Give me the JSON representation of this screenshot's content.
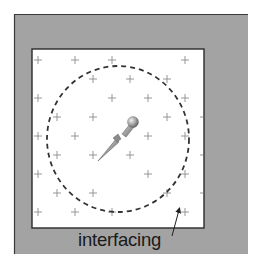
{
  "diagram": {
    "label": "interfacing",
    "colors": {
      "fabric_background": "#a3a3a3",
      "interfacing_fill": "#ffffff",
      "border": "#2a2a2a",
      "cross_marks": "#8c8c8c",
      "dashed_circle": "#333333",
      "pin_head": "#9a9a9a",
      "label_text": "#1a1a1a"
    },
    "outer_fabric": {
      "x": 14,
      "y": 14,
      "width": 234,
      "height": 240
    },
    "interfacing_square": {
      "x": 32,
      "y": 49,
      "width": 172,
      "height": 179
    },
    "dashed_circle": {
      "cx": 118,
      "cy": 139,
      "rx": 71,
      "ry": 73
    },
    "pin": {
      "head": {
        "cx": 133,
        "cy": 122,
        "r": 5
      },
      "tip": {
        "x": 98,
        "y": 161
      }
    },
    "arrow": {
      "from": {
        "x": 172,
        "y": 236
      },
      "to": {
        "x": 180,
        "y": 207
      }
    },
    "cross_marks": [
      {
        "x": 38,
        "y": 60
      },
      {
        "x": 75,
        "y": 60
      },
      {
        "x": 112,
        "y": 60
      },
      {
        "x": 185,
        "y": 60
      },
      {
        "x": 93,
        "y": 79
      },
      {
        "x": 130,
        "y": 79
      },
      {
        "x": 167,
        "y": 79
      },
      {
        "x": 38,
        "y": 98
      },
      {
        "x": 112,
        "y": 98
      },
      {
        "x": 148,
        "y": 98
      },
      {
        "x": 185,
        "y": 98
      },
      {
        "x": 57,
        "y": 117
      },
      {
        "x": 93,
        "y": 117
      },
      {
        "x": 167,
        "y": 117
      },
      {
        "x": 38,
        "y": 136
      },
      {
        "x": 75,
        "y": 136
      },
      {
        "x": 148,
        "y": 136
      },
      {
        "x": 185,
        "y": 136
      },
      {
        "x": 57,
        "y": 155
      },
      {
        "x": 93,
        "y": 155
      },
      {
        "x": 130,
        "y": 155
      },
      {
        "x": 38,
        "y": 174
      },
      {
        "x": 148,
        "y": 174
      },
      {
        "x": 185,
        "y": 174
      },
      {
        "x": 57,
        "y": 193
      },
      {
        "x": 93,
        "y": 193
      },
      {
        "x": 167,
        "y": 193
      },
      {
        "x": 38,
        "y": 212
      },
      {
        "x": 75,
        "y": 212
      },
      {
        "x": 112,
        "y": 212
      },
      {
        "x": 185,
        "y": 212
      }
    ],
    "edge_ticks": [
      {
        "x": 203,
        "y": 117
      },
      {
        "x": 203,
        "y": 155
      },
      {
        "x": 203,
        "y": 193
      }
    ]
  }
}
